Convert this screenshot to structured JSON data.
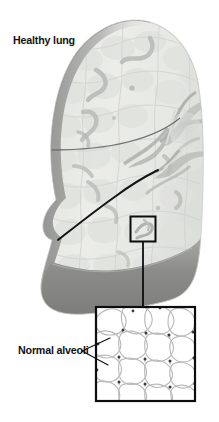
{
  "figure": {
    "title_label": "Healthy lung",
    "inset_label": "Normal alveoli",
    "colors": {
      "background": "#ffffff",
      "lung_fill_light": "#eceeea",
      "lung_fill_mid": "#dcdedb",
      "lung_edge_shadow": "#9a9a98",
      "lung_base_shadow": "#8d8d8b",
      "bronchi_gray": "#b0b2ae",
      "fissure_line": "#141414",
      "callout_stroke": "#0d0d0d",
      "alveoli_wall": "#b9b9b9",
      "alveoli_node": "#3a3a3a",
      "text": "#121212"
    },
    "callout_small_box": {
      "x": 130,
      "y": 216,
      "width": 26,
      "height": 26
    },
    "callout_inset_box": {
      "x": 95,
      "y": 306,
      "width": 101,
      "height": 96
    },
    "connector_line": {
      "x": 143,
      "y_start": 242,
      "y_end": 306
    },
    "leader_lines": 2
  }
}
